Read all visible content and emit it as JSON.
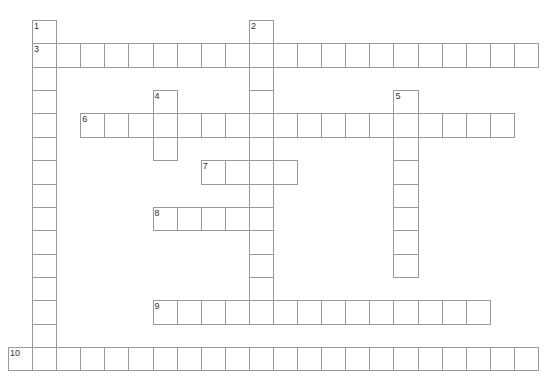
{
  "puzzle": {
    "cell_width": 24.09,
    "cell_height": 23.36,
    "origin_x": 8,
    "origin_y": 20,
    "line_color": "#9a9a9a",
    "number_color": "#333333",
    "words": [
      {
        "number": "1",
        "direction": "down",
        "col": 1,
        "row": 0,
        "length": 15
      },
      {
        "number": "2",
        "direction": "down",
        "col": 10,
        "row": 0,
        "length": 13
      },
      {
        "number": "3",
        "direction": "across",
        "col": 1,
        "row": 1,
        "length": 21
      },
      {
        "number": "4",
        "direction": "down",
        "col": 6,
        "row": 3,
        "length": 3
      },
      {
        "number": "5",
        "direction": "down",
        "col": 16,
        "row": 3,
        "length": 8
      },
      {
        "number": "6",
        "direction": "across",
        "col": 3,
        "row": 4,
        "length": 18
      },
      {
        "number": "7",
        "direction": "across",
        "col": 8,
        "row": 6,
        "length": 4
      },
      {
        "number": "8",
        "direction": "across",
        "col": 6,
        "row": 8,
        "length": 5
      },
      {
        "number": "9",
        "direction": "across",
        "col": 6,
        "row": 12,
        "length": 14
      },
      {
        "number": "10",
        "direction": "across",
        "col": 0,
        "row": 14,
        "length": 22
      }
    ]
  }
}
